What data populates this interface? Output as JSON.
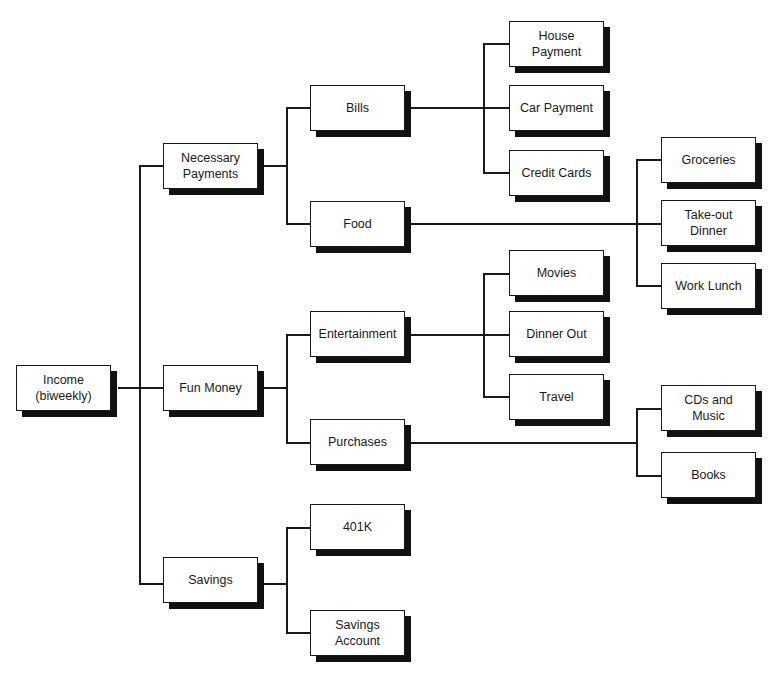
{
  "diagram": {
    "type": "hierarchy-tree",
    "colors": {
      "line": "#1a1a1a",
      "box_fill": "#ffffff",
      "box_shadow": "#111111"
    },
    "root": {
      "label": "Income\n(biweekly)"
    },
    "level1": {
      "necessary_payments": "Necessary\nPayments",
      "fun_money": "Fun Money",
      "savings": "Savings"
    },
    "level2": {
      "bills": "Bills",
      "food": "Food",
      "entertainment": "Entertainment",
      "purchases": "Purchases",
      "k401": "401K",
      "savings_account": "Savings\nAccount"
    },
    "level3": {
      "house_payment": "House\nPayment",
      "car_payment": "Car Payment",
      "credit_cards": "Credit Cards",
      "groceries": "Groceries",
      "takeout_dinner": "Take-out\nDinner",
      "work_lunch": "Work Lunch",
      "movies": "Movies",
      "dinner_out": "Dinner Out",
      "travel": "Travel",
      "cds_music": "CDs and\nMusic",
      "books": "Books"
    }
  }
}
